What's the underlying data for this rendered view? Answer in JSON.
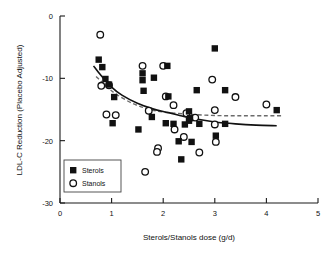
{
  "chart_data": {
    "type": "scatter",
    "title": "",
    "xlabel": "Sterols/Stanols dose (g/d)",
    "ylabel": "LDL-C Reduction (Placebo Adjusted)",
    "xlim": [
      0,
      5
    ],
    "ylim": [
      -30,
      0
    ],
    "xticks": [
      0,
      1,
      2,
      3,
      4,
      5
    ],
    "yticks": [
      0,
      -10,
      -20,
      -30
    ],
    "xtick_labels": [
      "0",
      "1",
      "2",
      "3",
      "4",
      "5"
    ],
    "ytick_labels": [
      "0",
      "-10",
      "-20",
      "-30"
    ],
    "grid": false,
    "legend_position": "lower-left",
    "series": [
      {
        "name": "Sterols",
        "marker": "filled-square",
        "color": "#111111",
        "points": [
          [
            0.75,
            -7.0
          ],
          [
            0.82,
            -8.2
          ],
          [
            0.88,
            -10.1
          ],
          [
            0.95,
            -11.0
          ],
          [
            1.05,
            -13.0
          ],
          [
            1.02,
            -17.2
          ],
          [
            1.52,
            -18.2
          ],
          [
            1.6,
            -9.2
          ],
          [
            1.6,
            -10.3
          ],
          [
            1.62,
            -12.0
          ],
          [
            1.78,
            -16.2
          ],
          [
            1.82,
            -9.9
          ],
          [
            2.08,
            -8.0
          ],
          [
            2.1,
            -12.9
          ],
          [
            2.05,
            -17.2
          ],
          [
            2.2,
            -17.3
          ],
          [
            2.3,
            -20.1
          ],
          [
            2.35,
            -23.0
          ],
          [
            2.5,
            -15.3
          ],
          [
            2.5,
            -16.8
          ],
          [
            2.52,
            -16.4
          ],
          [
            2.55,
            -20.2
          ],
          [
            2.42,
            -17.4
          ],
          [
            2.65,
            -11.9
          ],
          [
            2.7,
            -17.3
          ],
          [
            3.0,
            -5.2
          ],
          [
            3.02,
            -19.2
          ],
          [
            3.2,
            -11.9
          ],
          [
            3.2,
            -17.3
          ],
          [
            4.2,
            -15.1
          ]
        ]
      },
      {
        "name": "Stanols",
        "marker": "open-circle",
        "color": "#111111",
        "points": [
          [
            0.78,
            -3.0
          ],
          [
            0.8,
            -11.2
          ],
          [
            0.95,
            -11.1
          ],
          [
            0.9,
            -15.8
          ],
          [
            1.08,
            -15.9
          ],
          [
            1.6,
            -8.0
          ],
          [
            1.65,
            -25.0
          ],
          [
            1.72,
            -15.2
          ],
          [
            1.9,
            -21.2
          ],
          [
            1.88,
            -21.8
          ],
          [
            2.0,
            -8.0
          ],
          [
            2.05,
            -12.9
          ],
          [
            2.2,
            -14.3
          ],
          [
            2.22,
            -18.2
          ],
          [
            2.45,
            -15.6
          ],
          [
            2.4,
            -19.4
          ],
          [
            2.62,
            -16.3
          ],
          [
            2.7,
            -21.9
          ],
          [
            2.95,
            -10.2
          ],
          [
            3.0,
            -15.1
          ],
          [
            3.0,
            -17.4
          ],
          [
            3.02,
            -20.2
          ],
          [
            3.4,
            -13.0
          ],
          [
            4.0,
            -14.2
          ]
        ]
      }
    ],
    "fits": [
      {
        "name": "Sterols fit",
        "style": "solid",
        "color": "#111111",
        "points": [
          [
            0.65,
            -8.0
          ],
          [
            0.8,
            -9.6
          ],
          [
            1.0,
            -11.4
          ],
          [
            1.2,
            -12.7
          ],
          [
            1.5,
            -14.0
          ],
          [
            1.8,
            -14.9
          ],
          [
            2.1,
            -15.5
          ],
          [
            2.4,
            -16.1
          ],
          [
            2.7,
            -16.6
          ],
          [
            3.0,
            -17.0
          ],
          [
            3.4,
            -17.3
          ],
          [
            3.8,
            -17.5
          ],
          [
            4.2,
            -17.6
          ]
        ]
      },
      {
        "name": "Stanols fit",
        "style": "dashed",
        "color": "#6b6b6b",
        "points": [
          [
            0.7,
            -9.7
          ],
          [
            0.9,
            -11.3
          ],
          [
            1.1,
            -12.6
          ],
          [
            1.4,
            -14.0
          ],
          [
            1.7,
            -14.9
          ],
          [
            2.0,
            -15.4
          ],
          [
            2.4,
            -15.7
          ],
          [
            2.8,
            -15.9
          ],
          [
            3.2,
            -16.0
          ],
          [
            3.6,
            -16.0
          ],
          [
            4.0,
            -16.0
          ],
          [
            4.3,
            -16.0
          ]
        ]
      }
    ],
    "legend": [
      {
        "label": "Sterols",
        "marker": "filled-square"
      },
      {
        "label": "Stanols",
        "marker": "open-circle"
      }
    ]
  }
}
